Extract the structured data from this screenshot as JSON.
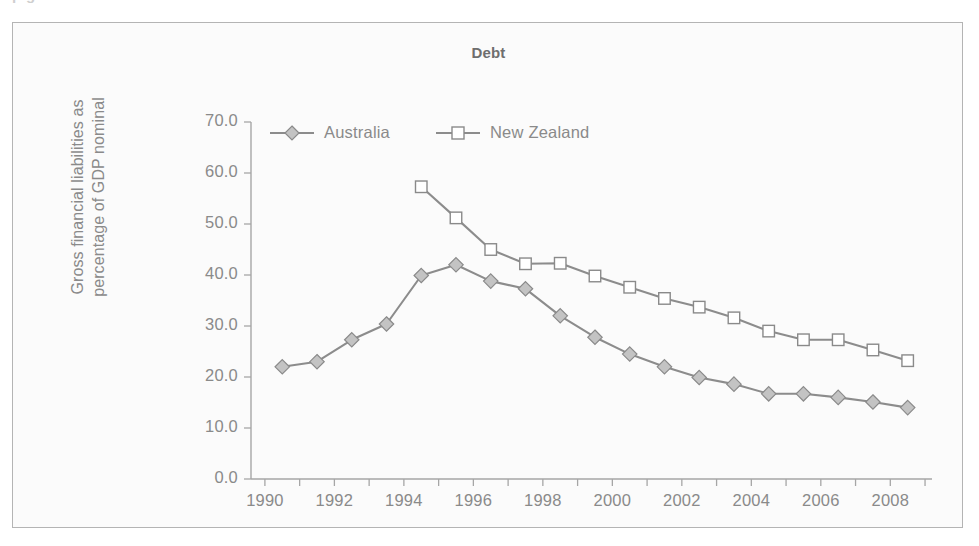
{
  "page": {
    "cut_off_heading": "p g"
  },
  "chart": {
    "title": "Debt",
    "y_axis_title_line1": "Gross financial liabilities as",
    "y_axis_title_line2": "percentage of GDP nominal",
    "y_ticks": [
      "0.0",
      "10.0",
      "20.0",
      "30.0",
      "40.0",
      "50.0",
      "60.0",
      "70.0"
    ],
    "x_ticks": [
      "1990",
      "1992",
      "1994",
      "1996",
      "1998",
      "2000",
      "2002",
      "2004",
      "2006",
      "2008"
    ],
    "legend": [
      {
        "label": "Australia",
        "marker": "diamond-icon",
        "color": "#c3c3c3"
      },
      {
        "label": "New Zealand",
        "marker": "square-icon",
        "color": "#ffffff"
      }
    ],
    "colors": {
      "line": "#8c8c8c",
      "axis": "#a6a6a6",
      "text": "#8a8a8a",
      "frame": "#b4b4b4",
      "plot_background": "#fbfbfb"
    }
  },
  "chart_data": {
    "type": "line",
    "title": "Debt",
    "xlabel": "",
    "ylabel": "Gross financial liabilities as percentage of GDP nominal",
    "xlim": [
      1989.6,
      2009.2
    ],
    "ylim": [
      0.0,
      70.0
    ],
    "ytick_step": 10.0,
    "xtick_step": 2,
    "xtick_minor_step": 1,
    "grid": false,
    "legend_position": "top-left-inside",
    "series": [
      {
        "name": "Australia",
        "marker": "diamond",
        "x": [
          1990.5,
          1991.5,
          1992.5,
          1993.5,
          1994.5,
          1995.5,
          1996.5,
          1997.5,
          1998.5,
          1999.5,
          2000.5,
          2001.5,
          2002.5,
          2003.5,
          2004.5,
          2005.5,
          2006.5,
          2007.5,
          2008.5
        ],
        "values": [
          22.0,
          23.0,
          27.3,
          30.4,
          39.9,
          42.0,
          38.8,
          37.3,
          32.0,
          27.8,
          24.5,
          22.0,
          19.9,
          18.6,
          16.7,
          16.7,
          16.0,
          15.1,
          14.0
        ]
      },
      {
        "name": "New Zealand",
        "marker": "square",
        "x": [
          1994.5,
          1995.5,
          1996.5,
          1997.5,
          1998.5,
          1999.5,
          2000.5,
          2001.5,
          2002.5,
          2003.5,
          2004.5,
          2005.5,
          2006.5,
          2007.5,
          2008.5
        ],
        "values": [
          57.3,
          51.2,
          45.0,
          42.2,
          42.3,
          39.8,
          37.6,
          35.4,
          33.7,
          31.6,
          29.0,
          27.3,
          27.3,
          25.3,
          23.2
        ]
      }
    ]
  }
}
